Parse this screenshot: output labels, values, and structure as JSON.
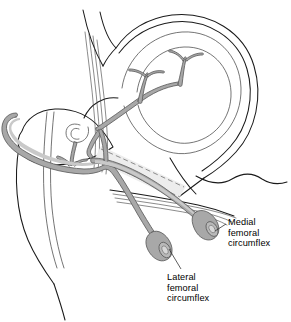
{
  "figure": {
    "name": "hip-vascular-anatomy-illustration",
    "type": "anatomical-line-drawing",
    "view": "anterolateral view of right hip",
    "background_color": "#ffffff",
    "line_color": "#1a1a1a",
    "vessel_fill_color": "#a8a8a8",
    "vessel_outline_color": "#5d5d5d",
    "text_color": "#000000"
  },
  "labels": [
    {
      "id": "medial-femoral-circumflex",
      "lines": [
        "Medial",
        "femoral",
        "circumflex"
      ],
      "full_text": "Medial femoral circumflex",
      "leader_from_x": 228,
      "leader_from_y": 222,
      "leader_to_x": 212,
      "leader_to_y": 232
    },
    {
      "id": "lateral-femoral-circumflex",
      "lines": [
        "Lateral",
        "femoral",
        "circumflex"
      ],
      "full_text": "Lateral femoral circumflex",
      "leader_from_x": 180,
      "leader_from_y": 270,
      "leader_to_x": 168,
      "leader_to_y": 248
    }
  ],
  "structures": [
    {
      "id": "ilium-pelvis",
      "label": "Ilium / acetabular rim",
      "kind": "bone-outline"
    },
    {
      "id": "acetabulum",
      "label": "Acetabulum",
      "kind": "bone-outline"
    },
    {
      "id": "femoral-head",
      "label": "Femoral head",
      "kind": "bone-outline"
    },
    {
      "id": "greater-trochanter",
      "label": "Greater trochanter",
      "kind": "bone-outline"
    },
    {
      "id": "femoral-shaft",
      "label": "Femoral shaft",
      "kind": "bone-outline"
    },
    {
      "id": "psoas-tendon",
      "label": "Psoas tendon striations",
      "kind": "soft-tissue"
    },
    {
      "id": "joint-capsule",
      "label": "Joint capsule",
      "kind": "soft-tissue"
    },
    {
      "id": "femoral-neck-hidden",
      "label": "Femoral neck (hidden, dashed)",
      "kind": "dashed-outline"
    },
    {
      "id": "retinacular-branches",
      "label": "Retinacular branches",
      "kind": "vessel"
    },
    {
      "id": "medial-circumflex-vessel",
      "label": "Medial femoral circumflex artery",
      "kind": "vessel"
    },
    {
      "id": "lateral-circumflex-vessel",
      "label": "Lateral femoral circumflex artery",
      "kind": "vessel"
    },
    {
      "id": "medial-vessel-cut-end",
      "label": "Medial vessel cut end",
      "kind": "vessel-terminus"
    },
    {
      "id": "lateral-vessel-cut-end",
      "label": "Lateral vessel cut end",
      "kind": "vessel-terminus"
    }
  ]
}
